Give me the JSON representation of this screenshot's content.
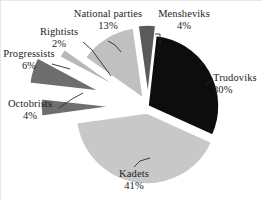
{
  "chart_data": {
    "type": "pie",
    "title": "",
    "subtitle": "",
    "xlabel": "",
    "ylabel": "",
    "legend_position": "none",
    "grid": false,
    "units": "percent",
    "categories": [
      "Mensheviks",
      "Trudoviks",
      "Kadets",
      "Octobrists",
      "Progressists",
      "Rightists",
      "National parties"
    ],
    "values": [
      4,
      30,
      41,
      4,
      6,
      2,
      13
    ],
    "slices": [
      {
        "name": "Mensheviks",
        "label": "Mensheviks",
        "percent": 4,
        "pct_label": "4%",
        "color": "#5a5a5a",
        "exploded": true,
        "explode_distance": 10,
        "start_angle": 352,
        "end_angle": 6.4
      },
      {
        "name": "Trudoviks",
        "label": "Trudoviks",
        "percent": 30,
        "pct_label": "30%",
        "color": "#0d0d0d",
        "exploded": false,
        "explode_distance": 4,
        "start_angle": 6.4,
        "end_angle": 114.4
      },
      {
        "name": "Kadets",
        "label": "Kadets",
        "percent": 41,
        "pct_label": "41%",
        "color": "#c8c8c8",
        "exploded": true,
        "explode_distance": 7,
        "start_angle": 114.4,
        "end_angle": 262
      },
      {
        "name": "Octobrists",
        "label": "Octobrists",
        "percent": 4,
        "pct_label": "4%",
        "color": "#6e6e6e",
        "exploded": true,
        "explode_distance": 36,
        "start_angle": 262,
        "end_angle": 276.4
      },
      {
        "name": "Progressists",
        "label": "Progressists",
        "percent": 6,
        "pct_label": "6%",
        "color": "#6e6e6e",
        "exploded": true,
        "explode_distance": 50,
        "start_angle": 276.4,
        "end_angle": 298
      },
      {
        "name": "Rightists",
        "label": "Rightists",
        "percent": 2,
        "pct_label": "2%",
        "color": "#b8b8b8",
        "exploded": true,
        "explode_distance": 30,
        "start_angle": 298,
        "end_angle": 305.2
      },
      {
        "name": "National parties",
        "label": "National parties",
        "percent": 13,
        "pct_label": "13%",
        "color": "#c0c0c0",
        "exploded": true,
        "explode_distance": 9,
        "start_angle": 305.2,
        "end_angle": 352
      }
    ],
    "geometry": {
      "cx": 148,
      "cy": 106,
      "r": 71
    },
    "colors": {
      "background": "#ffffff",
      "text": "#1d1d1d",
      "slice_border": "#ffffff",
      "leader_line": "#2a2a2a",
      "dark": "#0d0d0d",
      "mid_gray": "#6e6e6e",
      "light_gray": "#c8c8c8"
    }
  },
  "labels": {
    "national_parties": {
      "name": "National parties",
      "pct": "13%"
    },
    "mensheviks": {
      "name": "Mensheviks",
      "pct": "4%"
    },
    "rightists": {
      "name": "Rightists",
      "pct": "2%"
    },
    "progressists": {
      "name": "Progressists",
      "pct": "6%"
    },
    "octobrists": {
      "name": "Octobrists",
      "pct": "4%"
    },
    "trudoviks": {
      "name": "Trudoviks",
      "pct": "30%"
    },
    "kadets": {
      "name": "Kadets",
      "pct": "41%"
    }
  }
}
